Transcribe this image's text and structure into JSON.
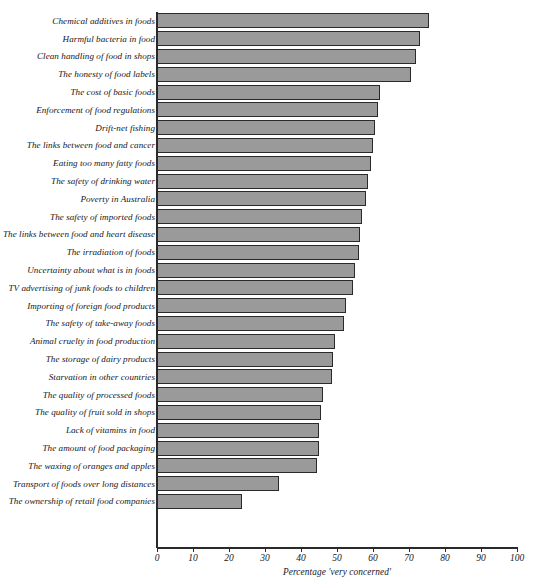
{
  "chart_data": {
    "type": "bar",
    "orientation": "horizontal",
    "title": "",
    "xlabel": "Percentage 'very concerned'",
    "ylabel": "",
    "xlim": [
      0,
      100
    ],
    "xticks": [
      0,
      10,
      20,
      30,
      40,
      50,
      60,
      70,
      80,
      90,
      100
    ],
    "grid": false,
    "legend": null,
    "bar_color": "#9a9a9a",
    "bar_edge_color": "#2a2a2a",
    "axis_color": "#2a2a2a",
    "categories": [
      "Chemical additives in foods",
      "Harmful bacteria in food",
      "Clean handling of food in shops",
      "The honesty of food labels",
      "The cost of basic foods",
      "Enforcement of food regulations",
      "Drift-net fishing",
      "The links between food and cancer",
      "Eating too many fatty foods",
      "The safety of drinking water",
      "Poverty in Australia",
      "The safety of imported foods",
      "The links between food and heart disease",
      "The irradiation of foods",
      "Uncertainty about what is in foods",
      "TV advertising of junk foods to children",
      "Importing of foreign food products",
      "The safety of take-away foods",
      "Animal cruelty in food production",
      "The storage of dairy products",
      "Starvation in other countries",
      "The quality of processed foods",
      "The quality of fruit sold in shops",
      "Lack of vitamins in food",
      "The amount of food packaging",
      "The waxing of oranges and apples",
      "Transport of foods over long distances",
      "The ownership of retail food companies"
    ],
    "values": [
      75.5,
      73.0,
      72.0,
      70.5,
      62.0,
      61.5,
      60.5,
      60.0,
      59.5,
      58.5,
      58.0,
      57.0,
      56.5,
      56.0,
      55.0,
      54.5,
      52.5,
      52.0,
      49.5,
      49.0,
      48.5,
      46.0,
      45.5,
      45.0,
      45.0,
      44.5,
      34.0,
      23.5
    ]
  }
}
